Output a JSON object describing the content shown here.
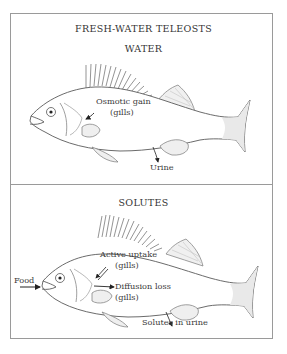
{
  "figure": {
    "main_title": "FRESH-WATER TELEOSTS",
    "panels": [
      {
        "heading": "WATER",
        "labels": {
          "osmotic_gain_line1": "Osmotic gain",
          "osmotic_gain_line2": "(gills)",
          "urine": "Urine"
        }
      },
      {
        "heading": "SOLUTES",
        "labels": {
          "food": "Food",
          "active_uptake_line1": "Active uptake",
          "active_uptake_line2": "(gills)",
          "diffusion_loss_line1": "Diffusion loss",
          "diffusion_loss_line2": "(gills)",
          "solutes_in_urine": "Solutes in urine"
        }
      }
    ]
  },
  "colors": {
    "line": "#5a5a5a",
    "frame": "#9a9a9a",
    "fin_fill": "#eeeeee",
    "arrow": "#222222"
  }
}
